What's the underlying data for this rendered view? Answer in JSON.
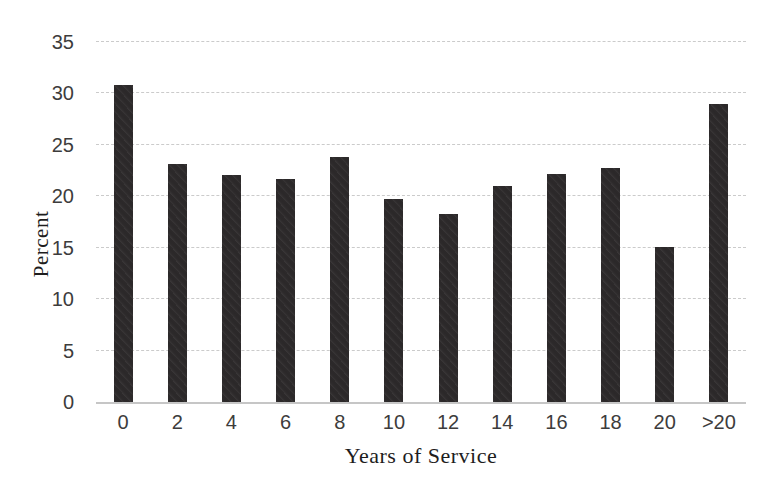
{
  "figure": {
    "background": "#ffffff"
  },
  "chart_data": {
    "type": "bar",
    "title": "",
    "xlabel": "Years of Service",
    "ylabel": "Percent",
    "categories": [
      "0",
      "2",
      "4",
      "6",
      "8",
      "10",
      "12",
      "14",
      "16",
      "18",
      "20",
      ">20"
    ],
    "values": [
      30.8,
      23.1,
      22.1,
      21.7,
      23.8,
      19.7,
      18.3,
      21.0,
      22.2,
      22.8,
      15.1,
      29.0
    ],
    "ylim": [
      0,
      35
    ],
    "yticks": [
      0,
      5,
      10,
      15,
      20,
      25,
      30,
      35
    ],
    "grid": true,
    "gridline_style": "dotted",
    "legend_position": "none",
    "bar_color": "#2d2a2b",
    "gridline_color": "#cbcbcb",
    "baseline_color": "#c6c6c6",
    "tick_label_color": "#3d3c3c",
    "axis_title_color": "#1e1d1d"
  }
}
